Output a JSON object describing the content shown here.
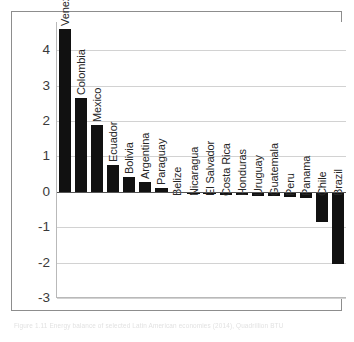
{
  "chart_data": {
    "type": "bar",
    "title": "",
    "xlabel": "",
    "ylabel": "Quadrillion BTU",
    "ylim": [
      -3,
      4.8
    ],
    "yticks": [
      4,
      3,
      2,
      1,
      0,
      -1,
      -2,
      -3
    ],
    "ytick_labels": [
      "4",
      "3",
      "2",
      "1",
      "0",
      "-1",
      "-2",
      "-3"
    ],
    "grid": true,
    "legend": "none",
    "bar_color": "#111111",
    "gridline_color": "#d2d2d2",
    "categories": [
      "Venezuela",
      "Colombia",
      "Mexico",
      "Ecuador",
      "Bolivia",
      "Argentina",
      "Paraguay",
      "Belize",
      "Nicaragua",
      "El Salvador",
      "Costa Rica",
      "Honduras",
      "Uruguay",
      "Guatemala",
      "Peru",
      "Panama",
      "Chile",
      "Brazil"
    ],
    "values": [
      4.6,
      2.64,
      1.9,
      0.75,
      0.42,
      0.28,
      0.1,
      -0.02,
      -0.06,
      -0.07,
      -0.09,
      -0.1,
      -0.11,
      -0.12,
      -0.14,
      -0.17,
      -0.85,
      -2.05
    ]
  },
  "caption": {
    "text": "Figure 1.11 Energy balance of selected Latin American economies (2014), Quadrillion BTU"
  }
}
